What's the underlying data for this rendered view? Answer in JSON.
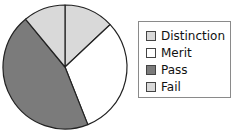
{
  "chart_data": {
    "type": "pie",
    "title": "",
    "categories": [
      "Distinction",
      "Merit",
      "Pass",
      "Fail"
    ],
    "values": [
      13,
      31,
      45,
      11
    ],
    "unit": "percent (estimated from slice angles)",
    "colors": [
      "#d9d9d9",
      "#ffffff",
      "#7b7b7b",
      "#d9d9d9"
    ],
    "start_angle": "12 o'clock",
    "direction": "clockwise",
    "legend": {
      "position": "right",
      "entries": [
        "Distinction",
        "Merit",
        "Pass",
        "Fail"
      ]
    }
  },
  "legend": {
    "items": [
      {
        "label": "Distinction",
        "color": "#d9d9d9"
      },
      {
        "label": "Merit",
        "color": "#ffffff"
      },
      {
        "label": "Pass",
        "color": "#7b7b7b"
      },
      {
        "label": "Fail",
        "color": "#d9d9d9"
      }
    ]
  }
}
